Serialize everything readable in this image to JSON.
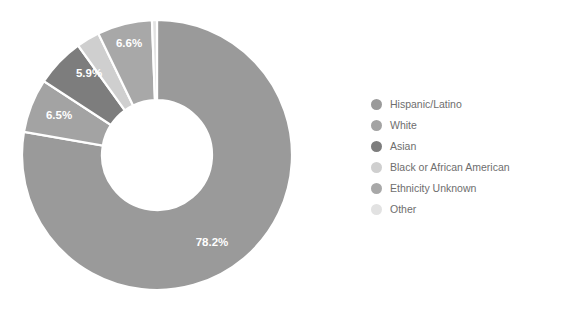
{
  "chart_data": {
    "type": "pie",
    "variant": "donut",
    "title": "",
    "subtitle": "",
    "xlabel": "",
    "ylabel": "",
    "grid": false,
    "legend_position": "right",
    "units": "percent",
    "start_angle_deg": 0,
    "direction": "clockwise",
    "center": {
      "x": 157,
      "y": 155
    },
    "outer_radius": 135,
    "inner_radius": 55,
    "categories": [
      "Hispanic/Latino",
      "White",
      "Asian",
      "Black or African American",
      "Ethnicity Unknown",
      "Other"
    ],
    "values": [
      78.2,
      6.5,
      5.9,
      2.8,
      6.6,
      0.6
    ],
    "colors": [
      "#9a9a9a",
      "#a3a3a3",
      "#7d7d7d",
      "#cfcfcf",
      "#a8a8a8",
      "#e2e2e2"
    ],
    "slices": [
      {
        "label": "Hispanic/Latino",
        "value": 78.2,
        "display": "78.2%",
        "color": "#9a9a9a",
        "show_label": true,
        "label_x": 212,
        "label_y": 243
      },
      {
        "label": "White",
        "value": 6.5,
        "display": "6.5%",
        "color": "#a3a3a3",
        "show_label": true,
        "label_x": 59,
        "label_y": 116
      },
      {
        "label": "Asian",
        "value": 5.9,
        "display": "5.9%",
        "color": "#7d7d7d",
        "show_label": true,
        "label_x": 89,
        "label_y": 74
      },
      {
        "label": "Black or African American",
        "value": 2.8,
        "display": "2.8%",
        "color": "#cfcfcf",
        "show_label": false,
        "label_x": 0,
        "label_y": 0
      },
      {
        "label": "Ethnicity Unknown",
        "value": 6.6,
        "display": "6.6%",
        "color": "#a8a8a8",
        "show_label": true,
        "label_x": 129,
        "label_y": 44
      },
      {
        "label": "Other",
        "value": 0.6,
        "display": "0.6%",
        "color": "#e2e2e2",
        "show_label": false,
        "label_x": 0,
        "label_y": 0
      }
    ]
  },
  "legend": {
    "items": [
      {
        "label": "Hispanic/Latino",
        "color": "#9a9a9a"
      },
      {
        "label": "White",
        "color": "#a3a3a3"
      },
      {
        "label": "Asian",
        "color": "#7d7d7d"
      },
      {
        "label": "Black or African American",
        "color": "#cfcfcf"
      },
      {
        "label": "Ethnicity Unknown",
        "color": "#a8a8a8"
      },
      {
        "label": "Other",
        "color": "#e2e2e2"
      }
    ]
  },
  "style": {
    "background": "#ffffff",
    "slice_gap_color": "#ffffff",
    "label_text_color": "#ffffff",
    "legend_text_color": "#6e6e6e"
  }
}
